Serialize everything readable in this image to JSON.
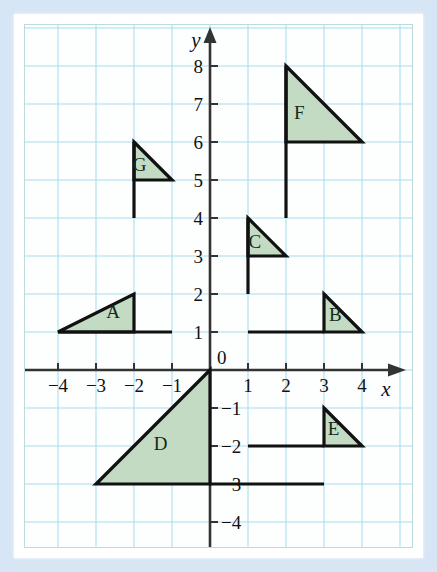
{
  "figure": {
    "background_color": "#d7e6f4",
    "paper_color": "#ffffff",
    "grid_color": "#aadcf0",
    "axis_color": "#333333",
    "flag_fill": "#c3dbc3",
    "flag_stroke": "#111111"
  },
  "axes": {
    "x_label": "x",
    "y_label": "y",
    "x_ticks": [
      "-4",
      "-3",
      "-2",
      "-1",
      "1",
      "2",
      "3",
      "4"
    ],
    "y_ticks": [
      "8",
      "7",
      "6",
      "5",
      "4",
      "3",
      "2",
      "1",
      "-1",
      "-2",
      "-3",
      "-4"
    ],
    "origin_label": "0",
    "x_range": [
      -4.6,
      4.6
    ],
    "y_range": [
      -4.6,
      8.9
    ],
    "unit_px": 38
  },
  "chart_data": {
    "type": "scatter",
    "xlabel": "x",
    "ylabel": "y",
    "xlim": [
      -4.6,
      4.6
    ],
    "ylim": [
      -4.6,
      8.9
    ],
    "grid": true,
    "legend": "none",
    "x_tick_values": [
      -4,
      -3,
      -2,
      -1,
      0,
      1,
      2,
      3,
      4
    ],
    "y_tick_values": [
      -4,
      -3,
      -2,
      -1,
      0,
      1,
      2,
      3,
      4,
      5,
      6,
      7,
      8
    ],
    "series": [
      {
        "name": "A",
        "label": "A",
        "label_pos": [
          -2.55,
          1.38
        ],
        "pole": [
          [
            -4,
            1
          ],
          [
            -1,
            1
          ]
        ],
        "triangle": [
          [
            -4,
            1
          ],
          [
            -2,
            2
          ],
          [
            -2,
            1
          ]
        ]
      },
      {
        "name": "B",
        "label": "B",
        "label_pos": [
          3.3,
          1.3
        ],
        "pole": [
          [
            1,
            1
          ],
          [
            3,
            1
          ]
        ],
        "triangle": [
          [
            3,
            2
          ],
          [
            4,
            1
          ],
          [
            3,
            1
          ]
        ]
      },
      {
        "name": "C",
        "label": "C",
        "label_pos": [
          1.18,
          3.22
        ],
        "pole": [
          [
            1,
            2
          ],
          [
            1,
            4
          ]
        ],
        "triangle": [
          [
            1,
            4
          ],
          [
            2,
            3
          ],
          [
            1,
            3
          ]
        ]
      },
      {
        "name": "D",
        "label": "D",
        "label_pos": [
          -1.3,
          -2.1
        ],
        "pole": [
          [
            0,
            -3
          ],
          [
            3,
            -3
          ]
        ],
        "triangle": [
          [
            0,
            0
          ],
          [
            -3,
            -3
          ],
          [
            0,
            -3
          ]
        ]
      },
      {
        "name": "E",
        "label": "E",
        "label_pos": [
          3.25,
          -1.72
        ],
        "pole": [
          [
            1,
            -2
          ],
          [
            3,
            -2
          ]
        ],
        "triangle": [
          [
            3,
            -1
          ],
          [
            4,
            -2
          ],
          [
            3,
            -2
          ]
        ]
      },
      {
        "name": "F",
        "label": "F",
        "label_pos": [
          2.35,
          6.6
        ],
        "pole": [
          [
            2,
            4
          ],
          [
            2,
            8
          ]
        ],
        "triangle": [
          [
            2,
            8
          ],
          [
            4,
            6
          ],
          [
            2,
            6
          ]
        ]
      },
      {
        "name": "G",
        "label": "G",
        "label_pos": [
          -1.85,
          5.25
        ],
        "pole": [
          [
            -2,
            4
          ],
          [
            -2,
            6
          ]
        ],
        "triangle": [
          [
            -2,
            6
          ],
          [
            -1,
            5
          ],
          [
            -2,
            5
          ]
        ]
      }
    ]
  }
}
